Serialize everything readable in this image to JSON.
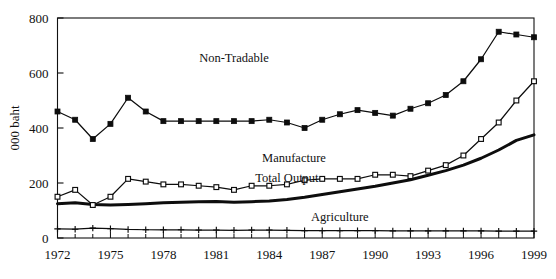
{
  "chart_data": {
    "type": "line",
    "title": "",
    "xlabel": "",
    "ylabel": "000 baht",
    "xlim": [
      1972,
      1999
    ],
    "ylim": [
      0,
      800
    ],
    "grid": false,
    "legend_position": "inline-annotations",
    "x": [
      1972,
      1973,
      1974,
      1975,
      1976,
      1977,
      1978,
      1979,
      1980,
      1981,
      1982,
      1983,
      1984,
      1985,
      1986,
      1987,
      1988,
      1989,
      1990,
      1991,
      1992,
      1993,
      1994,
      1995,
      1996,
      1997,
      1998,
      1999
    ],
    "xtick_labels": [
      "1972",
      "1975",
      "1978",
      "1981",
      "1984",
      "1987",
      "1990",
      "1993",
      "1996",
      "1999"
    ],
    "xtick_values": [
      1972,
      1975,
      1978,
      1981,
      1984,
      1987,
      1990,
      1993,
      1996,
      1999
    ],
    "ytick_labels": [
      "0",
      "200",
      "400",
      "600",
      "800"
    ],
    "ytick_values": [
      0,
      200,
      400,
      600,
      800
    ],
    "series": [
      {
        "name": "Non-Tradable",
        "marker": "filled-square",
        "label_x": 1982.0,
        "label_y": 640,
        "values": [
          460,
          430,
          360,
          415,
          510,
          460,
          425,
          425,
          425,
          425,
          425,
          425,
          430,
          420,
          400,
          430,
          450,
          465,
          455,
          445,
          470,
          490,
          520,
          570,
          650,
          750,
          740,
          730
        ]
      },
      {
        "name": "Manufacture",
        "marker": "open-square",
        "label_x": 1985.4,
        "label_y": 275,
        "values": [
          150,
          175,
          120,
          150,
          215,
          205,
          195,
          195,
          190,
          185,
          175,
          190,
          190,
          195,
          210,
          215,
          215,
          215,
          230,
          230,
          225,
          245,
          265,
          300,
          360,
          420,
          500,
          570
        ]
      },
      {
        "name": "Total Output",
        "marker": "none",
        "label_x": 1985.0,
        "label_y": 205,
        "values": [
          125,
          128,
          122,
          120,
          122,
          125,
          128,
          130,
          132,
          133,
          130,
          132,
          135,
          140,
          148,
          158,
          168,
          178,
          188,
          200,
          212,
          228,
          245,
          265,
          290,
          320,
          355,
          375
        ]
      },
      {
        "name": "Agriculture",
        "marker": "plus",
        "label_x": 1988.0,
        "label_y": 62,
        "values": [
          33,
          32,
          36,
          34,
          31,
          30,
          30,
          30,
          29,
          29,
          28,
          29,
          29,
          28,
          27,
          27,
          27,
          27,
          27,
          26,
          26,
          26,
          26,
          26,
          26,
          25,
          25,
          25
        ]
      }
    ]
  },
  "colors": {
    "ink": "#0d0d0d",
    "axis": "#111111",
    "background": "#ffffff"
  }
}
